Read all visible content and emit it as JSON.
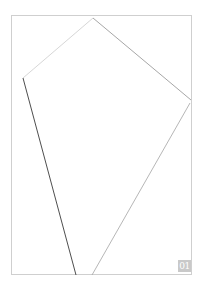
{
  "page": {
    "badge_text": "01",
    "frame_color": "#cfcfcf",
    "badge_color": "#c9c9c9"
  },
  "drawing": {
    "shape": "quadrilateral outline",
    "vertices": [
      {
        "name": "top",
        "x": 93,
        "y": 18
      },
      {
        "name": "right",
        "x": 191,
        "y": 100
      },
      {
        "name": "bottom-right",
        "x": 92,
        "y": 275
      },
      {
        "name": "bottom-left",
        "x": 76,
        "y": 275
      },
      {
        "name": "left",
        "x": 23,
        "y": 78
      }
    ],
    "segments": [
      {
        "from": "left",
        "to": "top",
        "color": "#c8c8c8"
      },
      {
        "from": "top",
        "to": "right",
        "color": "#9a9a9a"
      },
      {
        "from": "right",
        "to": "bottom-right",
        "color": "#a8a8a8"
      },
      {
        "from": "left",
        "to": "bottom-left",
        "color": "#444444"
      }
    ]
  }
}
